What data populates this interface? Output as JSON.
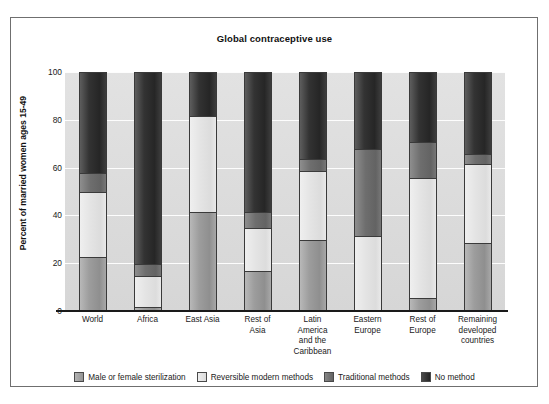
{
  "chart_data": {
    "type": "bar",
    "stacked": true,
    "orientation": "vertical",
    "title": "Global contraceptive use",
    "xlabel": "",
    "ylabel": "Percent of married women ages 15-49",
    "ylim": [
      0,
      100
    ],
    "yticks": [
      0,
      20,
      40,
      60,
      80,
      100
    ],
    "ytick_labels": [
      "0",
      "20",
      "40",
      "60",
      "80",
      "100"
    ],
    "grid": "horizontal",
    "legend_position": "bottom",
    "categories": [
      "World",
      "Africa",
      "East Asia",
      "Rest of Asia",
      "Latin America and the Caribbean",
      "Eastern Europe",
      "Rest of Europe",
      "Remaining developed countries"
    ],
    "category_label_lines": [
      [
        "World"
      ],
      [
        "Africa"
      ],
      [
        "East Asia"
      ],
      [
        "Rest of",
        "Asia"
      ],
      [
        "Latin",
        "America",
        "and the",
        "Caribbean"
      ],
      [
        "Eastern",
        "Europe"
      ],
      [
        "Rest of",
        "Europe"
      ],
      [
        "Remaining",
        "developed",
        "countries"
      ]
    ],
    "series": [
      {
        "name": "Male or female sterilization",
        "color": "#9d9d9d",
        "values": [
          23,
          2,
          42,
          17,
          30,
          1,
          6,
          29
        ]
      },
      {
        "name": "Reversible modern methods",
        "color": "#e4e4e4",
        "values": [
          27,
          13,
          40,
          18,
          29,
          31,
          50,
          33
        ]
      },
      {
        "name": "Traditional methods",
        "color": "#6e6e6e",
        "values": [
          8,
          5,
          0,
          7,
          5,
          36,
          15,
          4
        ]
      },
      {
        "name": "No method",
        "color": "#2b2b2b",
        "values": [
          42,
          80,
          18,
          58,
          36,
          32,
          29,
          34
        ]
      }
    ],
    "cumulative_tops": {
      "World": [
        23,
        50,
        58,
        100
      ],
      "Africa": [
        2,
        15,
        20,
        100
      ],
      "East Asia": [
        42,
        82,
        82,
        100
      ],
      "Rest of Asia": [
        17,
        35,
        42,
        100
      ],
      "Latin America and the Caribbean": [
        30,
        59,
        64,
        100
      ],
      "Eastern Europe": [
        1,
        32,
        68,
        100
      ],
      "Rest of Europe": [
        6,
        56,
        71,
        100
      ],
      "Remaining developed countries": [
        29,
        62,
        66,
        100
      ]
    }
  },
  "legend": {
    "items": [
      {
        "label": "Male or female sterilization",
        "swatch": "swatch-sterilization"
      },
      {
        "label": "Reversible modern methods",
        "swatch": "swatch-reversible"
      },
      {
        "label": "Traditional methods",
        "swatch": "swatch-traditional"
      },
      {
        "label": "No method",
        "swatch": "swatch-no-method"
      }
    ]
  }
}
